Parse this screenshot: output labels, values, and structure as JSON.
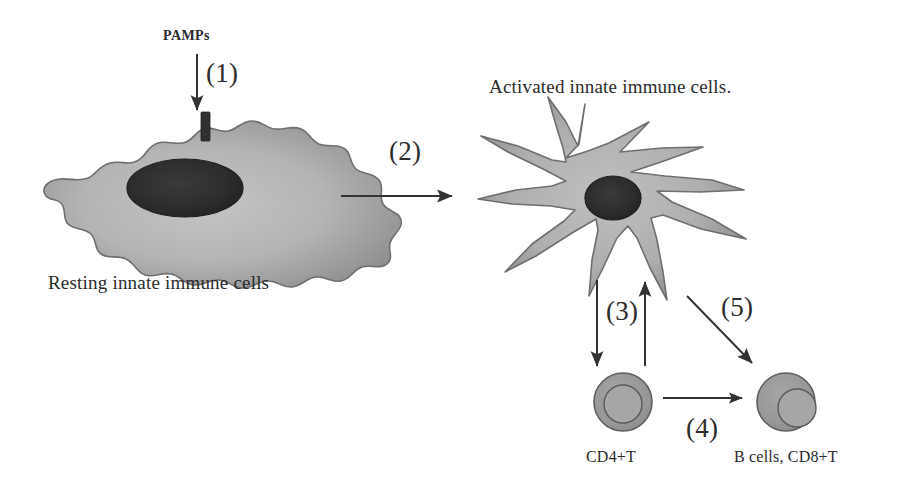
{
  "diagram": {
    "background_color": "#ffffff",
    "labels": {
      "pamps": "PAMPs",
      "resting_cell": "Resting innate immune cells",
      "activated_cell": "Activated innate immune cells.",
      "cd4_t": "CD4+T",
      "b_cells_cd8": "B cells, CD8+T"
    },
    "steps": {
      "step1": "(1)",
      "step2": "(2)",
      "step3": "(3)",
      "step4": "(4)",
      "step5": "(5)"
    },
    "colors": {
      "cytoplasm_light": "#b9b9b9",
      "cytoplasm_mid": "#9a9a9a",
      "cytoplasm_dark": "#7f7f7f",
      "nucleus_dark": "#2b2b2b",
      "lymphocyte_fill": "#979797",
      "lymphocyte_nucleus": "#a8a8a8",
      "outline": "#4a4a4a",
      "arrow": "#3a3a3a",
      "text": "#2b2b2b"
    },
    "elements": {
      "receptor_bar": "membrane-receptor",
      "resting_cell_shape": "amoeboid-macrophage",
      "activated_cell_shape": "stellate-dendritic-cell",
      "cd4_cell_shape": "round-lymphocyte-centered-nucleus",
      "b_cell_shape": "round-lymphocyte-offset-nucleus"
    },
    "arrows": [
      {
        "name": "pamps-arrow",
        "step": "(1)",
        "direction": "down",
        "from": "PAMPs",
        "to": "receptor"
      },
      {
        "name": "activation-arrow",
        "step": "(2)",
        "direction": "right",
        "from": "Resting innate immune cells",
        "to": "Activated innate immune cells."
      },
      {
        "name": "priming-arrow-down",
        "step": "(3)",
        "direction": "down",
        "from": "Activated innate immune cells.",
        "to": "CD4+T"
      },
      {
        "name": "feedback-arrow-up",
        "step": "(3)",
        "direction": "up",
        "from": "CD4+T",
        "to": "Activated innate immune cells."
      },
      {
        "name": "help-arrow",
        "step": "(4)",
        "direction": "right",
        "from": "CD4+T",
        "to": "B cells, CD8+T"
      },
      {
        "name": "cross-priming-arrow",
        "step": "(5)",
        "direction": "diagonal-down-right",
        "from": "Activated innate immune cells.",
        "to": "B cells, CD8+T"
      }
    ]
  }
}
